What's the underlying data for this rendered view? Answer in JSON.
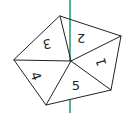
{
  "diagram": {
    "sections": [
      {
        "id": 1,
        "label": "1"
      },
      {
        "id": 2,
        "label": "2"
      },
      {
        "id": 3,
        "label": "3"
      },
      {
        "id": 4,
        "label": "4"
      },
      {
        "id": 5,
        "label": "5"
      }
    ],
    "line_color": "#2e9e6a",
    "edge_color": "#222222"
  }
}
